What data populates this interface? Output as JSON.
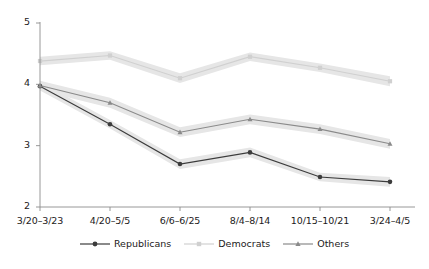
{
  "chart_data": {
    "type": "line",
    "title": "",
    "xlabel": "",
    "ylabel": "",
    "categories": [
      "3/20–3/23",
      "4/20–5/5",
      "6/6–6/25",
      "8/4–8/14",
      "10/15–10/21",
      "3/24–4/5"
    ],
    "yticks": [
      "2",
      "3",
      "4",
      "5"
    ],
    "ylim": [
      2,
      5
    ],
    "grid": false,
    "legend_position": "bottom",
    "bands": true,
    "series": [
      {
        "name": "Republicans",
        "color": "#3c3c3c",
        "marker": "circle",
        "values": [
          3.97,
          3.35,
          2.7,
          2.89,
          2.49,
          2.41
        ],
        "band_low": [
          3.9,
          3.28,
          2.62,
          2.81,
          2.42,
          2.33
        ],
        "band_high": [
          4.04,
          3.42,
          2.78,
          2.97,
          2.56,
          2.49
        ]
      },
      {
        "name": "Democrats",
        "color": "#d0d0d0",
        "marker": "square",
        "values": [
          4.38,
          4.47,
          4.1,
          4.45,
          4.27,
          4.05
        ],
        "band_low": [
          4.31,
          4.4,
          4.02,
          4.38,
          4.2,
          3.97
        ],
        "band_high": [
          4.45,
          4.54,
          4.18,
          4.52,
          4.34,
          4.13
        ]
      },
      {
        "name": "Others",
        "color": "#8a8a8a",
        "marker": "triangle",
        "values": [
          3.98,
          3.7,
          3.22,
          3.43,
          3.27,
          3.03
        ],
        "band_low": [
          3.9,
          3.62,
          3.14,
          3.35,
          3.19,
          2.95
        ],
        "band_high": [
          4.06,
          3.78,
          3.3,
          3.51,
          3.35,
          3.11
        ]
      }
    ]
  },
  "axes": {
    "axis_color": "#8c8c8c",
    "band_color": "#e6e6e6"
  },
  "legend": {
    "items": [
      {
        "label": "Republicans"
      },
      {
        "label": "Democrats"
      },
      {
        "label": "Others"
      }
    ]
  }
}
